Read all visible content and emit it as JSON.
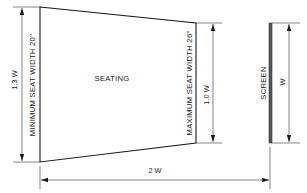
{
  "diagram": {
    "seating_label": "SEATING",
    "screen_label": "SCREEN",
    "min_seat_width_label": "MINIMUM SEAT WIDTH 20\"",
    "max_seat_width_label": "MAXIMUM SEAT WIDTH 26\"",
    "front_width_dim": "1.3 W",
    "rear_width_dim": "1.0 W",
    "screen_width_dim": "W",
    "depth_dim": "2 W"
  }
}
